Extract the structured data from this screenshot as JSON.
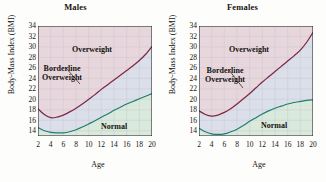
{
  "figure": {
    "background": "#fdfdfb"
  },
  "axes": {
    "ylabel": "Body-Mass Index (BMI)",
    "xlabel": "Age",
    "yticks": [
      "34",
      "32",
      "30",
      "28",
      "26",
      "24",
      "22",
      "20",
      "18",
      "16",
      "14"
    ],
    "xticks": [
      "2",
      "4",
      "6",
      "8",
      "10",
      "12",
      "14",
      "16",
      "18",
      "20"
    ]
  },
  "labels": {
    "overweight": "Overweight",
    "borderline_line1": "Borderline",
    "borderline_line2": "Overweight",
    "normal": "Normal"
  },
  "colors": {
    "overweight_fill": "#e7d7dd",
    "borderline_fill": "#dbdfe9",
    "normal_fill": "#d9e9dc",
    "upper_curve": "#7e2748",
    "lower_curve": "#1f7d6e",
    "grid": "#c3bfc6",
    "axis": "#1a1a1a",
    "text": "#15120f"
  },
  "chart_data": {
    "type": "line",
    "xlabel": "Age",
    "ylabel": "Body-Mass Index (BMI)",
    "xlim": [
      2,
      20
    ],
    "ylim": [
      13,
      34
    ],
    "xticks": [
      2,
      4,
      6,
      8,
      10,
      12,
      14,
      16,
      18,
      20
    ],
    "yticks": [
      14,
      16,
      18,
      20,
      22,
      24,
      26,
      28,
      30,
      32,
      34
    ],
    "grid": true,
    "legend": "none",
    "panels": [
      {
        "name": "Males",
        "title": "Males",
        "regions": [
          {
            "name": "Overweight",
            "fill": "#e7d7dd",
            "position": "above upper curve"
          },
          {
            "name": "Borderline Overweight",
            "fill": "#dbdfe9",
            "position": "between curves"
          },
          {
            "name": "Normal",
            "fill": "#d9e9dc",
            "position": "below lower curve"
          }
        ],
        "series": [
          {
            "name": "Borderline overweight threshold (85th percentile BMI)",
            "color": "#7e2748",
            "x": [
              2,
              3,
              4,
              5,
              6,
              7,
              8,
              9,
              10,
              11,
              12,
              13,
              14,
              15,
              16,
              17,
              18,
              19,
              20
            ],
            "values": [
              18.2,
              17.1,
              16.5,
              16.6,
              17.0,
              17.6,
              18.3,
              19.1,
              20.0,
              20.9,
              21.9,
              22.8,
              23.7,
              24.6,
              25.5,
              26.4,
              27.4,
              28.6,
              30.1
            ]
          },
          {
            "name": "Normal upper threshold (50th percentile BMI)",
            "color": "#1f7d6e",
            "x": [
              2,
              3,
              4,
              5,
              6,
              7,
              8,
              9,
              10,
              11,
              12,
              13,
              14,
              15,
              16,
              17,
              18,
              19,
              20
            ],
            "values": [
              14.6,
              14.0,
              13.7,
              13.6,
              13.6,
              13.8,
              14.2,
              14.7,
              15.3,
              15.9,
              16.6,
              17.2,
              17.9,
              18.5,
              19.1,
              19.6,
              20.1,
              20.6,
              21.1
            ]
          }
        ]
      },
      {
        "name": "Females",
        "title": "Females",
        "regions": [
          {
            "name": "Overweight",
            "fill": "#e7d7dd",
            "position": "above upper curve"
          },
          {
            "name": "Borderline Overweight",
            "fill": "#dbdfe9",
            "position": "between curves"
          },
          {
            "name": "Normal",
            "fill": "#d9e9dc",
            "position": "below lower curve"
          }
        ],
        "series": [
          {
            "name": "Borderline overweight threshold (85th percentile BMI)",
            "color": "#7e2748",
            "x": [
              2,
              3,
              4,
              5,
              6,
              7,
              8,
              9,
              10,
              11,
              12,
              13,
              14,
              15,
              16,
              17,
              18,
              19,
              20
            ],
            "values": [
              17.8,
              17.1,
              16.8,
              17.0,
              17.5,
              18.2,
              19.1,
              20.1,
              21.1,
              22.2,
              23.3,
              24.3,
              25.3,
              26.3,
              27.3,
              28.3,
              29.4,
              30.9,
              32.8
            ]
          },
          {
            "name": "Normal upper threshold (50th percentile BMI)",
            "color": "#1f7d6e",
            "x": [
              2,
              3,
              4,
              5,
              6,
              7,
              8,
              9,
              10,
              11,
              12,
              13,
              14,
              15,
              16,
              17,
              18,
              19,
              20
            ],
            "values": [
              14.5,
              13.8,
              13.4,
              13.3,
              13.4,
              13.8,
              14.3,
              15.0,
              15.8,
              16.5,
              17.2,
              17.8,
              18.3,
              18.7,
              19.1,
              19.4,
              19.6,
              19.8,
              19.9
            ]
          }
        ]
      }
    ],
    "annotations": [
      {
        "text": "Overweight",
        "panel": "Males"
      },
      {
        "text": "Borderline Overweight",
        "panel": "Males",
        "leader_line": true
      },
      {
        "text": "Normal",
        "panel": "Males"
      },
      {
        "text": "Overweight",
        "panel": "Females"
      },
      {
        "text": "Borderline Overweight",
        "panel": "Females",
        "leader_line": true
      },
      {
        "text": "Normal",
        "panel": "Females"
      }
    ]
  }
}
